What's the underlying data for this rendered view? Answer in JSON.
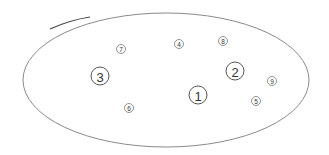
{
  "diagram": {
    "type": "numbered-markers-in-ellipse",
    "boundary": {
      "shape": "ellipse",
      "cx": 166,
      "cy": 80,
      "rx": 143,
      "ry": 67,
      "stroke": "#8a8a8a"
    },
    "markers": [
      {
        "label": "1",
        "x": 198,
        "y": 95,
        "size": "large"
      },
      {
        "label": "2",
        "x": 235,
        "y": 71,
        "size": "large"
      },
      {
        "label": "3",
        "x": 100,
        "y": 76,
        "size": "large"
      },
      {
        "label": "4",
        "x": 179,
        "y": 44,
        "size": "small"
      },
      {
        "label": "5",
        "x": 256,
        "y": 101,
        "size": "small"
      },
      {
        "label": "6",
        "x": 129,
        "y": 108,
        "size": "small"
      },
      {
        "label": "7",
        "x": 121,
        "y": 49,
        "size": "small"
      },
      {
        "label": "8",
        "x": 223,
        "y": 41,
        "size": "small"
      },
      {
        "label": "9",
        "x": 272,
        "y": 81,
        "size": "small"
      }
    ]
  }
}
